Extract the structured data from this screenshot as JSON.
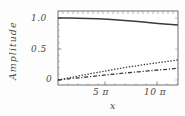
{
  "chart_data": {
    "type": "line",
    "title": "",
    "xlabel": "x",
    "ylabel": "Amplitude",
    "xlim": [
      0,
      12.566370614
    ],
    "ylim": [
      0,
      1.08
    ],
    "xunit": "pi",
    "grid": false,
    "legend": "none",
    "colors": {
      "axis": "#555555",
      "frame": "#555555",
      "curve": "#3a3a3a",
      "background": "#fdfdfd"
    },
    "xticks": [
      {
        "value": 5,
        "label": "5 π"
      },
      {
        "value": 10,
        "label": "10 π"
      }
    ],
    "yticks": [
      {
        "value": 0,
        "label": "0"
      },
      {
        "value": 0.5,
        "label": "0.5"
      },
      {
        "value": 1.0,
        "label": "1.0"
      }
    ],
    "x": [
      0,
      1,
      2,
      3,
      4,
      5,
      6,
      7,
      8,
      9,
      10,
      11,
      12
    ],
    "series": [
      {
        "name": "curve-solid",
        "style": "solid",
        "values": [
          1.0,
          0.999,
          0.996,
          0.992,
          0.986,
          0.978,
          0.968,
          0.956,
          0.943,
          0.928,
          0.912,
          0.899,
          0.888
        ]
      },
      {
        "name": "curve-dotted",
        "style": "dotted",
        "values": [
          0.0,
          0.032,
          0.063,
          0.094,
          0.124,
          0.153,
          0.181,
          0.208,
          0.233,
          0.257,
          0.279,
          0.3,
          0.326
        ]
      },
      {
        "name": "curve-dashdot",
        "style": "dash-dot",
        "values": [
          0.0,
          0.017,
          0.034,
          0.051,
          0.068,
          0.085,
          0.101,
          0.117,
          0.132,
          0.147,
          0.161,
          0.174,
          0.19
        ]
      }
    ]
  },
  "axes": {
    "ylabel": "Amplitude",
    "xlabel": "x",
    "ytick_labels": [
      "1.0",
      "0.5",
      "0"
    ],
    "xtick_labels": [
      "5 π",
      "10 π"
    ]
  }
}
